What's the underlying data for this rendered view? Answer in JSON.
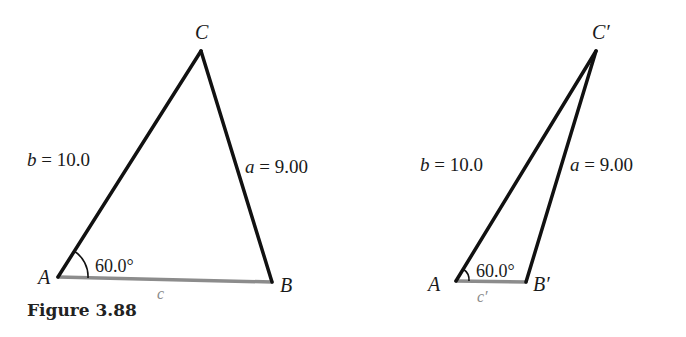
{
  "figure": {
    "caption": "Figure 3.88"
  },
  "colors": {
    "edge": "#111111",
    "base_edge": "#8c8c8c",
    "label": "#1a1a1a",
    "base_label": "#8a8a8a"
  },
  "triangle_left": {
    "vertices": {
      "A": {
        "label": "A",
        "x": 58,
        "y": 277
      },
      "B": {
        "label": "B",
        "x": 272,
        "y": 282
      },
      "C": {
        "label": "C",
        "x": 201,
        "y": 51
      }
    },
    "sides": {
      "b": {
        "var": "b",
        "eq": " = ",
        "value": "10.0"
      },
      "a": {
        "var": "a",
        "eq": " = ",
        "value": "9.00"
      },
      "c": {
        "var": "c"
      }
    },
    "angle_A": "60.0°"
  },
  "triangle_right": {
    "vertices": {
      "A": {
        "label": "A",
        "x": 456,
        "y": 281
      },
      "B": {
        "label": "B′",
        "x": 526,
        "y": 282
      },
      "C": {
        "label": "C′",
        "x": 596,
        "y": 51
      }
    },
    "sides": {
      "b": {
        "var": "b",
        "eq": " = ",
        "value": "10.0"
      },
      "a": {
        "var": "a",
        "eq": " = ",
        "value": "9.00"
      },
      "c": {
        "var": "c′"
      }
    },
    "angle_A": "60.0°"
  }
}
